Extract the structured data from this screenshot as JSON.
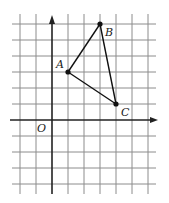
{
  "diagram": {
    "type": "coordinate-grid-triangle",
    "grid": {
      "x_range": [
        -2,
        6
      ],
      "y_range": [
        -4,
        6
      ],
      "unit_px": 16,
      "origin_px": [
        52,
        120
      ],
      "line_color": "#8c8c8c",
      "axis_color": "#222222"
    },
    "origin_label": "O",
    "points": [
      {
        "name": "A",
        "label": "A",
        "x": 1,
        "y": 3
      },
      {
        "name": "B",
        "label": "B",
        "x": 3,
        "y": 6
      },
      {
        "name": "C",
        "label": "C",
        "x": 4,
        "y": 1
      }
    ],
    "segments": [
      [
        "A",
        "B"
      ],
      [
        "B",
        "C"
      ],
      [
        "C",
        "A"
      ]
    ]
  }
}
